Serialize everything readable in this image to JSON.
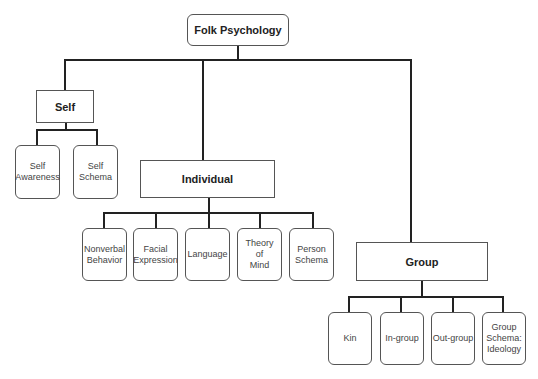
{
  "root": {
    "label": "Folk Psychology"
  },
  "branches": {
    "self": {
      "label": "Self",
      "children": [
        "Self\nAwareness",
        "Self\nSchema"
      ]
    },
    "individual": {
      "label": "Individual",
      "children": [
        "Nonverbal\nBehavior",
        "Facial\nExpression",
        "Language",
        "Theory\nof\nMind",
        "Person\nSchema"
      ]
    },
    "group": {
      "label": "Group",
      "children": [
        "Kin",
        "In-group",
        "Out-group",
        "Group\nSchema:\nIdeology"
      ]
    }
  }
}
